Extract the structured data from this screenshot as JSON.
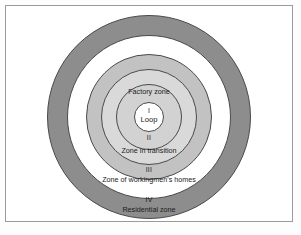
{
  "figure": {
    "background_color": "#ffffff",
    "frame_color": "#9a9a9a"
  },
  "chart_data": {
    "type": "pie",
    "xlabel": "",
    "ylabel": "",
    "legend_position": "none",
    "grid": false,
    "zones": [
      {
        "numeral": "I",
        "name": "Loop",
        "outer_radius": 15,
        "fill": "#ffffff",
        "stroke": "#4a4a4a"
      },
      {
        "numeral": "II",
        "name": "Zone in transition",
        "secondary_name": "Factory zone",
        "outer_radius": 48,
        "fill": "#d9d9d9",
        "stroke": "#4a4a4a"
      },
      {
        "numeral": "III",
        "name": "Zone of workingmen's homes",
        "outer_radius": 63,
        "fill": "#c2c2c2",
        "stroke": "#4a4a4a"
      },
      {
        "numeral": "IV",
        "name": "Residential zone",
        "outer_radius": 82,
        "fill": "#ffffff",
        "stroke": "#4a4a4a"
      },
      {
        "numeral": "",
        "name": "Commuter zone",
        "outer_radius": 102,
        "fill": "#8d8d8d",
        "stroke": "#4a4a4a"
      }
    ]
  },
  "labels": {
    "factory_zone": "Factory zone",
    "numeral_i": "I",
    "loop": "Loop",
    "numeral_ii": "II",
    "zone_in_transition": "Zone in transition",
    "numeral_iii": "III",
    "workingmens_homes": "Zone of workingmen's homes",
    "numeral_iv": "IV",
    "residential_zone": "Residential zone",
    "commuter_zone": "Commuter zone"
  }
}
